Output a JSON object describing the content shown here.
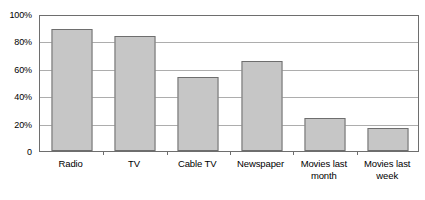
{
  "chart_data": {
    "type": "bar",
    "title": "",
    "subtitle": "",
    "xlabel": "",
    "ylabel": "",
    "categories": [
      "Radio",
      "TV",
      "Cable TV",
      "Newspaper",
      "Movies last month",
      "Movies last week"
    ],
    "values": [
      89,
      84,
      54,
      66,
      24,
      17
    ],
    "ylim": [
      0,
      100
    ],
    "y_ticks": [
      0,
      20,
      40,
      60,
      80,
      100
    ],
    "y_tick_labels": [
      "0",
      "20%",
      "40%",
      "60%",
      "80%",
      "100%"
    ],
    "grid": true,
    "grid_axis": "y",
    "legend": false,
    "legend_position": "none",
    "value_unit": "percent",
    "bar_fill_color": "#c6c6c6",
    "bar_border_color": "#6e6e6e",
    "gridline_color": "#adadad",
    "axis_color": "#6e6e6e",
    "background_color": "#ffffff",
    "text_color": "#000000"
  }
}
